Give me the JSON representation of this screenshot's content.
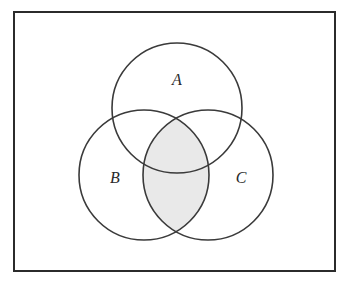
{
  "diagram": {
    "type": "venn",
    "universe": {
      "x": 14,
      "y": 12,
      "width": 321,
      "height": 259,
      "stroke": "#2b2b2b"
    },
    "sets": [
      {
        "id": "A",
        "label": "A",
        "cx": 177,
        "cy": 108,
        "r": 65,
        "label_x": 177,
        "label_y": 85
      },
      {
        "id": "B",
        "label": "B",
        "cx": 144,
        "cy": 175,
        "r": 65,
        "label_x": 115,
        "label_y": 183
      },
      {
        "id": "C",
        "label": "C",
        "cx": 208,
        "cy": 175,
        "r": 65,
        "label_x": 241,
        "label_y": 183
      }
    ],
    "shaded_region": {
      "description": "B ∩ C",
      "fill": "#e9e9e9"
    },
    "stroke_color": "#3a3a3a"
  }
}
